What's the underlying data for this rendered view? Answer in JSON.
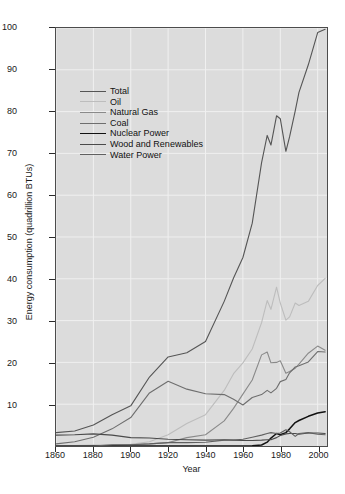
{
  "figure": {
    "title_remnant": "",
    "background": "#ffffff",
    "panel_background": "#dcdcdc",
    "grid_color": "#f0f0f0",
    "axis_color": "#4c4c4c"
  },
  "axes": {
    "xlabel": "Year",
    "ylabel": "Energy consumption (quadrillion BTUs)",
    "yticks": [
      10,
      20,
      30,
      40,
      50,
      60,
      70,
      80,
      90,
      100
    ],
    "xticks": [
      1860,
      1880,
      1900,
      1920,
      1940,
      1960,
      1980,
      2000
    ]
  },
  "legend": {
    "entries": [
      {
        "label": "Total",
        "color": "#555555"
      },
      {
        "label": "Oil",
        "color": "#bdbdbd"
      },
      {
        "label": "Natural Gas",
        "color": "#8a8a8a"
      },
      {
        "label": "Coal",
        "color": "#6e6e6e"
      },
      {
        "label": "Nuclear Power",
        "color": "#111111"
      },
      {
        "label": "Wood and Renewables",
        "color": "#4a4a4a"
      },
      {
        "label": "Water Power",
        "color": "#606060"
      }
    ]
  },
  "chart_data": {
    "type": "line",
    "title": "",
    "xlabel": "Year",
    "ylabel": "Energy consumption (quadrillion BTUs)",
    "xlim": [
      1860,
      2005
    ],
    "ylim": [
      0,
      100
    ],
    "grid": true,
    "legend_position": "upper-left-inside",
    "x": [
      1860,
      1870,
      1880,
      1890,
      1900,
      1910,
      1920,
      1930,
      1940,
      1950,
      1955,
      1960,
      1965,
      1970,
      1973,
      1975,
      1978,
      1980,
      1983,
      1985,
      1988,
      1990,
      1995,
      2000,
      2004
    ],
    "series": [
      {
        "name": "Total",
        "color": "#555555",
        "width": 1.1,
        "values": [
          3.2,
          3.6,
          5.0,
          7.5,
          9.6,
          16.5,
          21.3,
          22.3,
          25.0,
          34.6,
          40.2,
          45.1,
          53.3,
          67.8,
          74.3,
          72.0,
          79.0,
          78.3,
          70.5,
          74.0,
          80.2,
          84.6,
          91.2,
          98.9,
          99.7
        ]
      },
      {
        "name": "Oil",
        "color": "#bdbdbd",
        "width": 1.1,
        "values": [
          0.0,
          0.1,
          0.2,
          0.3,
          0.4,
          1.0,
          2.7,
          5.4,
          7.5,
          13.3,
          17.3,
          19.9,
          23.2,
          29.5,
          34.8,
          32.7,
          38.0,
          34.2,
          30.1,
          30.9,
          34.2,
          33.6,
          34.6,
          38.4,
          40.1
        ]
      },
      {
        "name": "Natural Gas",
        "color": "#8a8a8a",
        "width": 1.1,
        "values": [
          0.0,
          0.0,
          0.0,
          0.1,
          0.3,
          0.5,
          0.8,
          2.0,
          2.7,
          6.0,
          9.0,
          12.4,
          15.8,
          21.8,
          22.5,
          19.9,
          20.0,
          20.4,
          17.4,
          17.8,
          18.6,
          19.6,
          22.2,
          23.9,
          22.9
        ]
      },
      {
        "name": "Coal",
        "color": "#6e6e6e",
        "width": 1.1,
        "values": [
          0.5,
          1.0,
          2.1,
          4.1,
          6.8,
          12.7,
          15.5,
          13.6,
          12.5,
          12.3,
          11.2,
          9.8,
          11.6,
          12.3,
          13.3,
          12.7,
          13.8,
          15.4,
          15.9,
          17.5,
          18.9,
          19.2,
          20.1,
          22.6,
          22.5
        ]
      },
      {
        "name": "Nuclear Power",
        "color": "#111111",
        "width": 1.5,
        "values": [
          0.0,
          0.0,
          0.0,
          0.0,
          0.0,
          0.0,
          0.0,
          0.0,
          0.0,
          0.0,
          0.0,
          0.0,
          0.04,
          0.24,
          0.91,
          1.9,
          3.0,
          2.7,
          3.2,
          4.1,
          5.6,
          6.1,
          7.1,
          7.9,
          8.2
        ]
      },
      {
        "name": "Wood and Renewables",
        "color": "#4a4a4a",
        "width": 1.1,
        "values": [
          2.6,
          2.7,
          2.9,
          2.6,
          2.0,
          1.9,
          1.6,
          1.5,
          1.4,
          1.5,
          1.4,
          1.3,
          1.3,
          1.4,
          1.5,
          1.5,
          2.0,
          2.5,
          2.9,
          3.0,
          3.0,
          2.8,
          3.1,
          3.1,
          3.0
        ]
      },
      {
        "name": "Water Power",
        "color": "#606060",
        "width": 1.1,
        "values": [
          0.0,
          0.0,
          0.0,
          0.3,
          0.3,
          0.5,
          0.8,
          0.8,
          0.9,
          1.4,
          1.4,
          1.6,
          2.1,
          2.6,
          3.0,
          3.2,
          3.0,
          3.1,
          3.9,
          3.4,
          2.3,
          3.0,
          3.2,
          2.8,
          2.7
        ]
      }
    ]
  }
}
